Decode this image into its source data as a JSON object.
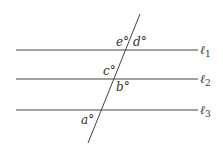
{
  "diagram": {
    "type": "parallel lines cut by a transversal",
    "lines": [
      {
        "name": "l1",
        "symbol": "ℓ",
        "subscript": "1",
        "y": 50
      },
      {
        "name": "l2",
        "symbol": "ℓ",
        "subscript": "2",
        "y": 79
      },
      {
        "name": "l3",
        "symbol": "ℓ",
        "subscript": "3",
        "y": 110
      }
    ],
    "transversal": {
      "x1": 140,
      "y1": 14,
      "x2": 88,
      "y2": 143
    },
    "angles": [
      {
        "name": "e",
        "label": "e°",
        "x": 116,
        "y": 46
      },
      {
        "name": "d",
        "label": "d°",
        "x": 133,
        "y": 46
      },
      {
        "name": "c",
        "label": "c°",
        "x": 103,
        "y": 75
      },
      {
        "name": "b",
        "label": "b°",
        "x": 116,
        "y": 91
      },
      {
        "name": "a",
        "label": "a°",
        "x": 81,
        "y": 124
      }
    ],
    "color": "#333333"
  }
}
